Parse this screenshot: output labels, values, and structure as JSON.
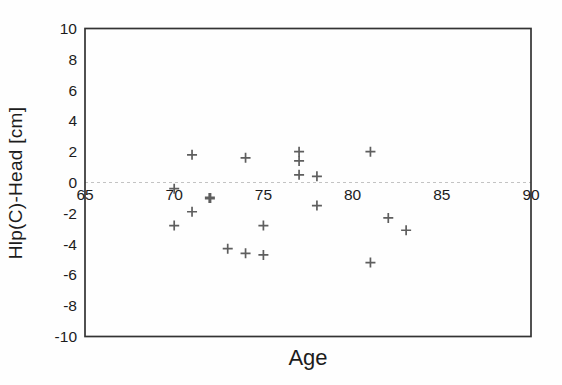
{
  "figure": {
    "background": "#fefefe",
    "frame_color": "#333333",
    "zero_line_color": "#c3c3c3",
    "text_color": "#1c1c1c"
  },
  "chart_data": {
    "type": "scatter",
    "title": "",
    "xlabel": "Age",
    "ylabel": "Hlp(C)-Head [cm]",
    "xlim": [
      65,
      90
    ],
    "ylim": [
      -10,
      10
    ],
    "x_ticks": [
      65,
      70,
      75,
      80,
      85,
      90
    ],
    "y_ticks": [
      10,
      8,
      6,
      4,
      2,
      0,
      -2,
      -4,
      -6,
      -8,
      -10
    ],
    "grid": "single light dashed horizontal line at y=0; x tick labels sit just below it inside the frame",
    "legend": "none",
    "marker": {
      "symbol": "plus",
      "color": "#5e5e5e"
    },
    "points": [
      {
        "x": 70,
        "y": -0.4
      },
      {
        "x": 70,
        "y": -2.8
      },
      {
        "x": 71,
        "y": 1.8
      },
      {
        "x": 71,
        "y": -1.9
      },
      {
        "x": 72,
        "y": -1.0,
        "bold": true
      },
      {
        "x": 73,
        "y": -4.3
      },
      {
        "x": 74,
        "y": 1.6
      },
      {
        "x": 74,
        "y": -4.6
      },
      {
        "x": 75,
        "y": -2.8
      },
      {
        "x": 75,
        "y": -4.7
      },
      {
        "x": 77,
        "y": 2.0
      },
      {
        "x": 77,
        "y": 1.4
      },
      {
        "x": 77,
        "y": 0.5
      },
      {
        "x": 78,
        "y": 0.4
      },
      {
        "x": 78,
        "y": -1.5
      },
      {
        "x": 81,
        "y": 2.0
      },
      {
        "x": 81,
        "y": -5.2
      },
      {
        "x": 82,
        "y": -2.3
      },
      {
        "x": 83,
        "y": -3.1
      }
    ]
  }
}
